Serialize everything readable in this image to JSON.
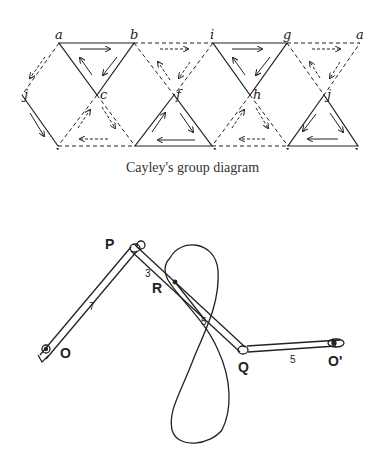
{
  "cayley": {
    "caption": "Cayley's group diagram",
    "top_labels": [
      "a",
      "b",
      "i",
      "g",
      "a"
    ],
    "middle_labels": [
      "j",
      "c",
      "f",
      "h",
      "j"
    ],
    "bottom_labels": [
      "k",
      "e",
      "d",
      "l",
      "k"
    ]
  },
  "linkage": {
    "points": {
      "P": "P",
      "R": "R",
      "Q": "Q",
      "O": "O",
      "O_prime": "O'"
    },
    "rod_labels": {
      "OP": "7",
      "PR": "3",
      "RQ": "5",
      "QO_prime": "5"
    }
  },
  "colors": {
    "ink": "#222222",
    "paper": "#ffffff"
  }
}
